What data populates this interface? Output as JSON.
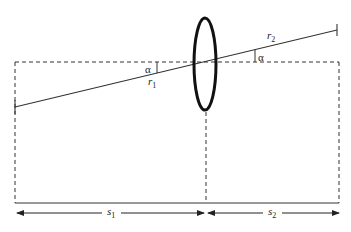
{
  "diagram": {
    "type": "thin-lens-geometry",
    "colors": {
      "line": "#333333",
      "lens": "#111111",
      "background": "#ffffff"
    },
    "labels": {
      "alpha_left": "α",
      "alpha_right": "α",
      "r1": "r",
      "r1_sub": "1",
      "r2": "r",
      "r2_sub": "2",
      "s1": "s",
      "s1_sub": "1",
      "s2": "s",
      "s2_sub": "2"
    }
  }
}
